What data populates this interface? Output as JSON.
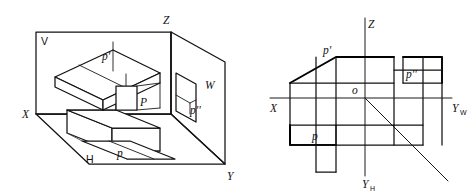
{
  "figure": {
    "kind": "orthographic-projection-diagram",
    "background_color": "#ffffff",
    "line_color": "#000000",
    "panels": [
      {
        "id": "pictorial",
        "name": "three-plane-pictorial-view",
        "labels": {
          "plane_v": "V",
          "plane_h": "H",
          "plane_w": "W",
          "axis_x": "X",
          "axis_y": "Y",
          "axis_z": "Z",
          "front_projection": "p'",
          "side_projection": "p''",
          "top_projection": "p",
          "solid_face": "P"
        }
      },
      {
        "id": "multiview",
        "name": "unfolded-three-view-drawing",
        "labels": {
          "axis_x": "X",
          "axis_z": "Z",
          "axis_yw": "Y",
          "axis_yw_sub": "W",
          "axis_yh": "Y",
          "axis_yh_sub": "H",
          "origin": "o",
          "front_view": "p'",
          "side_view": "p''",
          "top_view": "p"
        }
      }
    ]
  }
}
